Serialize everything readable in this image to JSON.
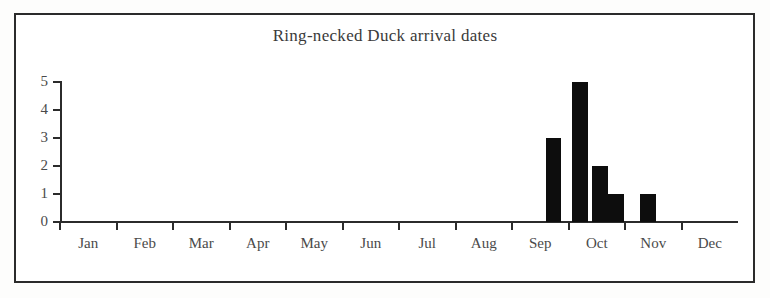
{
  "figure": {
    "background_color": "#ffffff",
    "frame_color": "#2b2b2b",
    "axis_color": "#2b2b2b",
    "bar_color": "#0d0d0d"
  },
  "chart_data": {
    "type": "bar",
    "title": "Ring-necked Duck arrival dates",
    "xlabel": "",
    "ylabel": "",
    "ylim": [
      0,
      5
    ],
    "yticks": [
      0,
      1,
      2,
      3,
      4,
      5
    ],
    "ytick_labels": [
      "0",
      "1",
      "2",
      "3",
      "4",
      "5"
    ],
    "grid": false,
    "legend": false,
    "categories": [
      "Jan",
      "Feb",
      "Mar",
      "Apr",
      "May",
      "Jun",
      "Jul",
      "Aug",
      "Sep",
      "Oct",
      "Nov",
      "Dec"
    ],
    "xtick_labels": [
      "Jan",
      "Feb",
      "Mar",
      "Apr",
      "May",
      "Jun",
      "Jul",
      "Aug",
      "Sep",
      "Oct",
      "Nov",
      "Dec"
    ],
    "note": "Histogram binned finer than months; bars fall in late Sep through early Nov.",
    "bars": [
      {
        "label": "late Sep",
        "value": 3,
        "x_px": 546,
        "width_px": 15
      },
      {
        "label": "early Oct",
        "value": 5,
        "x_px": 572,
        "width_px": 16
      },
      {
        "label": "mid Oct",
        "value": 2,
        "x_px": 592,
        "width_px": 16
      },
      {
        "label": "late Oct",
        "value": 1,
        "x_px": 608,
        "width_px": 16
      },
      {
        "label": "early Nov",
        "value": 1,
        "x_px": 640,
        "width_px": 16
      }
    ],
    "values": [
      0,
      0,
      0,
      0,
      0,
      0,
      0,
      0,
      3,
      8,
      1,
      0
    ],
    "total_observations": 12
  }
}
